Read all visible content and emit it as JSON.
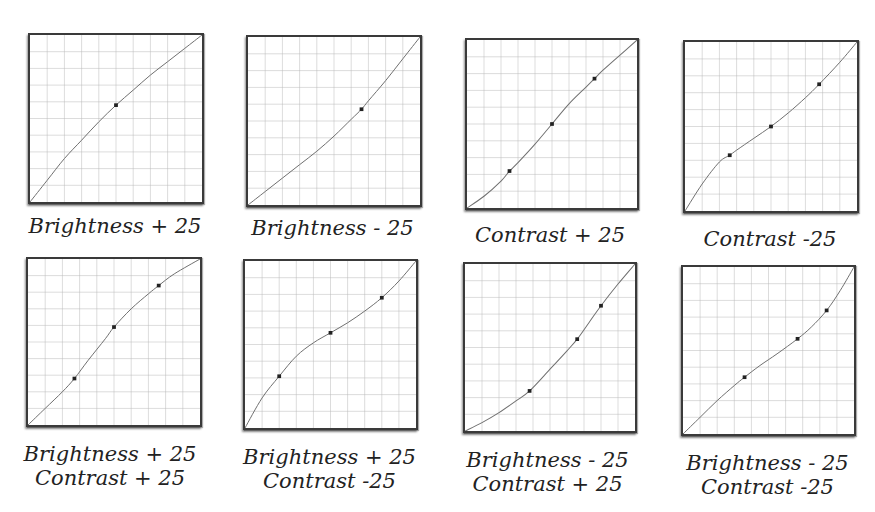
{
  "chart_data": [
    {
      "type": "line",
      "title": "Brightness + 25",
      "caption_lines": [
        "Brightness + 25"
      ],
      "grid": {
        "divisions": 10,
        "on": true
      },
      "xlim": [
        0,
        1
      ],
      "ylim": [
        0,
        1
      ],
      "control_points": [
        [
          0.5,
          0.58
        ]
      ],
      "curve": [
        [
          0,
          0
        ],
        [
          0.1,
          0.13
        ],
        [
          0.2,
          0.26
        ],
        [
          0.3,
          0.37
        ],
        [
          0.4,
          0.48
        ],
        [
          0.5,
          0.58
        ],
        [
          0.6,
          0.67
        ],
        [
          0.7,
          0.76
        ],
        [
          0.8,
          0.84
        ],
        [
          0.9,
          0.92
        ],
        [
          1,
          1
        ]
      ]
    },
    {
      "type": "line",
      "title": "Brightness - 25",
      "caption_lines": [
        "Brightness - 25"
      ],
      "grid": {
        "divisions": 10,
        "on": true
      },
      "xlim": [
        0,
        1
      ],
      "ylim": [
        0,
        1
      ],
      "control_points": [
        [
          0.66,
          0.57
        ]
      ],
      "curve": [
        [
          0,
          0
        ],
        [
          0.1,
          0.08
        ],
        [
          0.2,
          0.16
        ],
        [
          0.3,
          0.24
        ],
        [
          0.4,
          0.32
        ],
        [
          0.5,
          0.41
        ],
        [
          0.6,
          0.51
        ],
        [
          0.66,
          0.57
        ],
        [
          0.7,
          0.62
        ],
        [
          0.8,
          0.74
        ],
        [
          0.9,
          0.87
        ],
        [
          1,
          1
        ]
      ]
    },
    {
      "type": "line",
      "title": "Contrast + 25",
      "caption_lines": [
        "Contrast + 25"
      ],
      "grid": {
        "divisions": 10,
        "on": true
      },
      "xlim": [
        0,
        1
      ],
      "ylim": [
        0,
        1
      ],
      "control_points": [
        [
          0.25,
          0.22
        ],
        [
          0.5,
          0.5
        ],
        [
          0.75,
          0.77
        ]
      ],
      "curve": [
        [
          0,
          0
        ],
        [
          0.1,
          0.07
        ],
        [
          0.2,
          0.16
        ],
        [
          0.25,
          0.22
        ],
        [
          0.3,
          0.27
        ],
        [
          0.4,
          0.38
        ],
        [
          0.5,
          0.5
        ],
        [
          0.6,
          0.62
        ],
        [
          0.7,
          0.72
        ],
        [
          0.75,
          0.77
        ],
        [
          0.8,
          0.82
        ],
        [
          0.9,
          0.91
        ],
        [
          1,
          1
        ]
      ]
    },
    {
      "type": "line",
      "title": "Contrast -25",
      "caption_lines": [
        "Contrast -25"
      ],
      "grid": {
        "divisions": 10,
        "on": true
      },
      "xlim": [
        0,
        1
      ],
      "ylim": [
        0,
        1
      ],
      "control_points": [
        [
          0.26,
          0.33
        ],
        [
          0.5,
          0.5
        ],
        [
          0.78,
          0.75
        ]
      ],
      "curve": [
        [
          0,
          0
        ],
        [
          0.1,
          0.16
        ],
        [
          0.2,
          0.29
        ],
        [
          0.26,
          0.33
        ],
        [
          0.3,
          0.36
        ],
        [
          0.4,
          0.43
        ],
        [
          0.5,
          0.5
        ],
        [
          0.6,
          0.58
        ],
        [
          0.7,
          0.67
        ],
        [
          0.78,
          0.75
        ],
        [
          0.9,
          0.88
        ],
        [
          1,
          1
        ]
      ]
    },
    {
      "type": "line",
      "title": "Brightness + 25 / Contrast + 25",
      "caption_lines": [
        "Brightness + 25",
        "Contrast + 25"
      ],
      "grid": {
        "divisions": 10,
        "on": true
      },
      "xlim": [
        0,
        1
      ],
      "ylim": [
        0,
        1
      ],
      "control_points": [
        [
          0.27,
          0.28
        ],
        [
          0.5,
          0.59
        ],
        [
          0.76,
          0.84
        ]
      ],
      "curve": [
        [
          0,
          0
        ],
        [
          0.1,
          0.1
        ],
        [
          0.2,
          0.2
        ],
        [
          0.27,
          0.28
        ],
        [
          0.35,
          0.39
        ],
        [
          0.45,
          0.52
        ],
        [
          0.5,
          0.59
        ],
        [
          0.6,
          0.7
        ],
        [
          0.7,
          0.79
        ],
        [
          0.76,
          0.84
        ],
        [
          0.85,
          0.91
        ],
        [
          1,
          1
        ]
      ]
    },
    {
      "type": "line",
      "title": "Brightness + 25 / Contrast -25",
      "caption_lines": [
        "Brightness + 25",
        "Contrast -25"
      ],
      "grid": {
        "divisions": 10,
        "on": true
      },
      "xlim": [
        0,
        1
      ],
      "ylim": [
        0,
        1
      ],
      "control_points": [
        [
          0.2,
          0.31
        ],
        [
          0.5,
          0.57
        ],
        [
          0.8,
          0.78
        ]
      ],
      "curve": [
        [
          0,
          0
        ],
        [
          0.1,
          0.18
        ],
        [
          0.2,
          0.31
        ],
        [
          0.3,
          0.43
        ],
        [
          0.4,
          0.51
        ],
        [
          0.5,
          0.57
        ],
        [
          0.6,
          0.63
        ],
        [
          0.7,
          0.7
        ],
        [
          0.8,
          0.78
        ],
        [
          0.9,
          0.88
        ],
        [
          1,
          1
        ]
      ]
    },
    {
      "type": "line",
      "title": "Brightness - 25 / Contrast + 25",
      "caption_lines": [
        "Brightness - 25",
        "Contrast + 25"
      ],
      "grid": {
        "divisions": 10,
        "on": true
      },
      "xlim": [
        0,
        1
      ],
      "ylim": [
        0,
        1
      ],
      "control_points": [
        [
          0.38,
          0.24
        ],
        [
          0.66,
          0.55
        ],
        [
          0.8,
          0.75
        ]
      ],
      "curve": [
        [
          0,
          0
        ],
        [
          0.1,
          0.05
        ],
        [
          0.2,
          0.11
        ],
        [
          0.3,
          0.18
        ],
        [
          0.38,
          0.24
        ],
        [
          0.5,
          0.37
        ],
        [
          0.6,
          0.48
        ],
        [
          0.66,
          0.55
        ],
        [
          0.73,
          0.65
        ],
        [
          0.8,
          0.75
        ],
        [
          0.9,
          0.88
        ],
        [
          1,
          1
        ]
      ]
    },
    {
      "type": "line",
      "title": "Brightness - 25 / Contrast -25",
      "caption_lines": [
        "Brightness - 25",
        "Contrast -25"
      ],
      "grid": {
        "divisions": 10,
        "on": true
      },
      "xlim": [
        0,
        1
      ],
      "ylim": [
        0,
        1
      ],
      "control_points": [
        [
          0.36,
          0.34
        ],
        [
          0.67,
          0.57
        ],
        [
          0.84,
          0.74
        ]
      ],
      "curve": [
        [
          0,
          0
        ],
        [
          0.1,
          0.1
        ],
        [
          0.2,
          0.2
        ],
        [
          0.3,
          0.29
        ],
        [
          0.36,
          0.34
        ],
        [
          0.45,
          0.41
        ],
        [
          0.55,
          0.48
        ],
        [
          0.67,
          0.57
        ],
        [
          0.75,
          0.64
        ],
        [
          0.84,
          0.74
        ],
        [
          0.92,
          0.86
        ],
        [
          1,
          1
        ]
      ]
    }
  ],
  "panels": [
    {
      "caption": [
        "Brightness + 25"
      ]
    },
    {
      "caption": [
        "Brightness - 25"
      ]
    },
    {
      "caption": [
        "Contrast + 25"
      ]
    },
    {
      "caption": [
        "Contrast -25"
      ]
    },
    {
      "caption": [
        "Brightness + 25",
        "Contrast + 25"
      ]
    },
    {
      "caption": [
        "Brightness + 25",
        "Contrast -25"
      ]
    },
    {
      "caption": [
        "Brightness - 25",
        "Contrast + 25"
      ]
    },
    {
      "caption": [
        "Brightness - 25",
        "Contrast -25"
      ]
    }
  ],
  "colors": {
    "background": "#ffffff",
    "frame": "#3a3a3a",
    "grid": "#b8b8b8",
    "curve": "#707070",
    "point": "#222222",
    "caption": "#222222"
  }
}
